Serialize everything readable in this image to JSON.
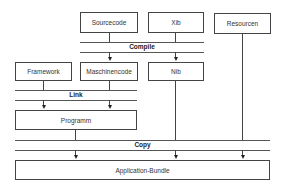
{
  "diagram": {
    "nodes": {
      "sourcecode": "Sourcecode",
      "xib": "Xib",
      "resourcen": "Resourcen",
      "framework": "Framework",
      "maschinencode": "Maschinencode",
      "nib": "Nib",
      "programm": "Programm",
      "application_bundle": "Application-Bundle"
    },
    "stages": {
      "compile": "Compile",
      "link": "Link",
      "copy": "Copy"
    },
    "edges": [
      {
        "from": "Sourcecode",
        "to": "Maschinencode",
        "via": "Compile"
      },
      {
        "from": "Xib",
        "to": "Nib",
        "via": "Compile"
      },
      {
        "from": "Framework",
        "to": "Programm",
        "via": "Link"
      },
      {
        "from": "Maschinencode",
        "to": "Programm",
        "via": "Link"
      },
      {
        "from": "Programm",
        "to": "Application-Bundle",
        "via": "Copy"
      },
      {
        "from": "Nib",
        "to": "Application-Bundle",
        "via": "Copy"
      },
      {
        "from": "Resourcen",
        "to": "Application-Bundle",
        "via": "Copy"
      }
    ]
  }
}
